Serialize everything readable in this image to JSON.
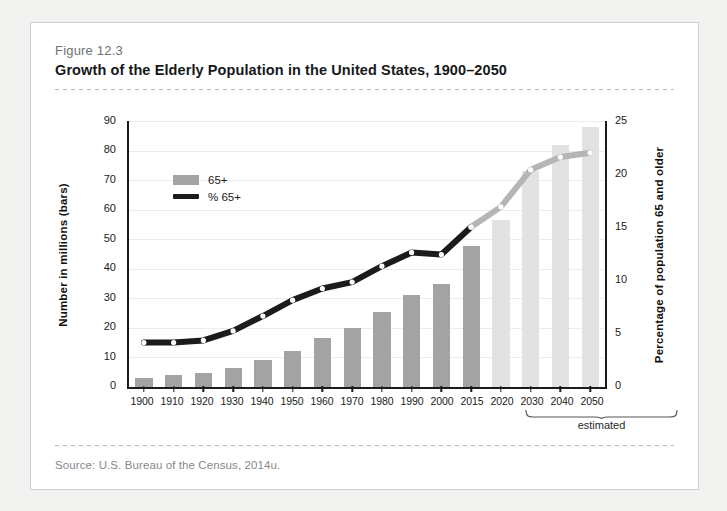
{
  "figure": {
    "number": "Figure 12.3",
    "title": "Growth of the Elderly Population in the United States, 1900–2050",
    "source": "Source:  U.S. Bureau of the Census, 2014u."
  },
  "annotations": {
    "estimated_label": "estimated"
  },
  "colors": {
    "bar_actual": "#a3a3a3",
    "bar_estimated": "#e2e2e2",
    "line_actual": "#1b1b1b",
    "line_estimated": "#b5b5b5",
    "axis": "#1b1b1b",
    "grid": "#ececed",
    "card_background": "#ffffff",
    "page_background": "#f2f2f0"
  },
  "chart_data": {
    "type": "bar",
    "title": "Growth of the Elderly Population in the United States, 1900–2050",
    "xlabel": "",
    "ylabel": "Number in millions (bars)",
    "y2label": "Percentage of population 65 and older",
    "ylim": [
      0,
      90
    ],
    "y2lim": [
      0,
      25
    ],
    "yticks": [
      0,
      10,
      20,
      30,
      40,
      50,
      60,
      70,
      80,
      90
    ],
    "y2ticks": [
      0,
      5,
      10,
      15,
      20,
      25
    ],
    "grid": true,
    "legend_position": "upper-left",
    "categories": [
      "1900",
      "1910",
      "1920",
      "1930",
      "1940",
      "1950",
      "1960",
      "1970",
      "1980",
      "1990",
      "2000",
      "2015",
      "2020",
      "2030",
      "2040",
      "2050"
    ],
    "estimated_categories": [
      "2020",
      "2030",
      "2040",
      "2050"
    ],
    "series": [
      {
        "name": "65+",
        "type": "bar",
        "axis": "left",
        "unit": "millions",
        "values": [
          3.1,
          4.0,
          4.9,
          6.6,
          9.0,
          12.3,
          16.6,
          20.1,
          25.5,
          31.2,
          35.0,
          47.7,
          56.4,
          73.0,
          81.9,
          88.0
        ]
      },
      {
        "name": "% 65+",
        "type": "line",
        "axis": "right",
        "unit": "percent",
        "values": [
          4.1,
          4.1,
          4.3,
          5.2,
          6.6,
          8.1,
          9.2,
          9.8,
          11.3,
          12.6,
          12.4,
          15.0,
          16.9,
          20.4,
          21.6,
          22.0
        ]
      }
    ]
  }
}
